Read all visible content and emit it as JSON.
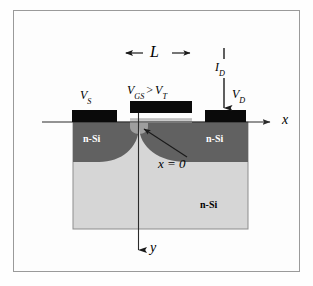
{
  "figure": {
    "type": "device-cross-section-diagram"
  },
  "colors": {
    "frame_border": "#9a9a9a",
    "contact_metal": "#0a0a0a",
    "source_drain_region": "#606060",
    "substrate_region": "#d4d4d4",
    "oxide_layer": "#c9c9c9",
    "axis_line": "#2b2b2b",
    "label_text": "#000000",
    "nsi_light_text": "#ffffff",
    "background": "#fefefe"
  },
  "labels": {
    "channel_length": "L",
    "gate_voltage": "V",
    "gate_voltage_sub": "GS",
    "gate_condition_operator": ">",
    "threshold_voltage": "V",
    "threshold_voltage_sub": "T",
    "source_voltage": "V",
    "source_voltage_sub": "S",
    "drain_voltage": "V",
    "drain_voltage_sub": "D",
    "drain_current": "I",
    "drain_current_sub": "D",
    "x_axis": "x",
    "y_axis": "y",
    "origin_note": "x = 0",
    "source_region": "n-Si",
    "drain_region": "n-Si",
    "substrate_region": "n-Si"
  },
  "regions": {
    "source_contact": {
      "label": "source-contact",
      "x": 72,
      "y": 110,
      "width": 44,
      "height": 12
    },
    "gate_contact": {
      "label": "gate-contact",
      "x": 130,
      "y": 101,
      "width": 62,
      "height": 12
    },
    "drain_contact": {
      "label": "drain-contact",
      "x": 205,
      "y": 110,
      "width": 41,
      "height": 12
    },
    "substrate": {
      "label": "substrate-body",
      "x": 73,
      "y": 122,
      "width": 175,
      "height": 107
    },
    "source_diffusion": {
      "label": "source-n-diffusion"
    },
    "drain_diffusion": {
      "label": "drain-n-diffusion"
    }
  },
  "axes": {
    "x": {
      "from_x": 42,
      "to_x": 272,
      "y": 122,
      "arrow": "right",
      "label_x": 284,
      "label_y": 118
    },
    "y": {
      "x": 138,
      "from_y": 104,
      "to_y": 254,
      "arrow": "down",
      "label_x": 151,
      "label_y": 244
    }
  },
  "annotations": {
    "length_arrow": {
      "from_x": 125,
      "to_x": 191,
      "y": 53,
      "style": "double-headed"
    },
    "current_arrow": {
      "x": 224,
      "tick_from_y": 48,
      "tick_to_y": 59,
      "arrow_from_y": 78,
      "arrow_to_y": 110
    },
    "origin_pointer": {
      "from_x": 186,
      "from_y": 158,
      "to_x": 143,
      "to_y": 130
    }
  }
}
